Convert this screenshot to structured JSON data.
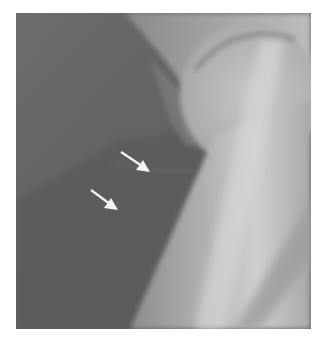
{
  "image": {
    "kind": "radiograph",
    "description": "Grayscale X-ray of hip joint region with femoral head and neck, two white arrows pointing to a faint soft-tissue finding",
    "frame": {
      "x": 16,
      "y": 13,
      "width": 295,
      "height": 316
    },
    "colors": {
      "background": "#ffffff",
      "soft_tissue_dark": "#5e5e5e",
      "soft_tissue_mid": "#6f6f6f",
      "bone_light": "#b8b8b8",
      "bone_bright": "#d2d2d2",
      "arrow": "#f4f4f4"
    },
    "arrows": [
      {
        "name": "upper-arrow",
        "from": [
          121,
          152
        ],
        "to": [
          150,
          172
        ]
      },
      {
        "name": "lower-arrow",
        "from": [
          91,
          190
        ],
        "to": [
          118,
          210
        ]
      }
    ]
  }
}
